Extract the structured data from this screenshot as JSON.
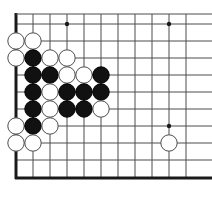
{
  "diagram": {
    "kind": "go-board-corner-diagram",
    "board": {
      "origin_x": 16,
      "origin_y": 24,
      "cell": 17,
      "cols": 11,
      "rows": 9,
      "edge_left_x": 16,
      "edge_top_y": 14,
      "edge_bottom_y": 178,
      "line_color": "#4d4d4d",
      "edge_color": "#1a1a1a",
      "background": "#ffffff",
      "line_width": 1,
      "edge_width": 3
    },
    "star_points": [
      {
        "col": 3,
        "row": 0
      },
      {
        "col": 9,
        "row": 0
      },
      {
        "col": 9,
        "row": 6
      }
    ],
    "star_point_radius": 2.2,
    "stone_radius": 8.2,
    "stones": [
      {
        "col": 0,
        "row": 1,
        "color": "white"
      },
      {
        "col": 1,
        "row": 1,
        "color": "white"
      },
      {
        "col": 0,
        "row": 2,
        "color": "white"
      },
      {
        "col": 1,
        "row": 2,
        "color": "black"
      },
      {
        "col": 2,
        "row": 2,
        "color": "white"
      },
      {
        "col": 3,
        "row": 2,
        "color": "white"
      },
      {
        "col": 1,
        "row": 3,
        "color": "black"
      },
      {
        "col": 2,
        "row": 3,
        "color": "black"
      },
      {
        "col": 3,
        "row": 3,
        "color": "white"
      },
      {
        "col": 4,
        "row": 3,
        "color": "white"
      },
      {
        "col": 5,
        "row": 3,
        "color": "black"
      },
      {
        "col": 1,
        "row": 4,
        "color": "black"
      },
      {
        "col": 2,
        "row": 4,
        "color": "white"
      },
      {
        "col": 3,
        "row": 4,
        "color": "black"
      },
      {
        "col": 4,
        "row": 4,
        "color": "black"
      },
      {
        "col": 5,
        "row": 4,
        "color": "black"
      },
      {
        "col": 1,
        "row": 5,
        "color": "black"
      },
      {
        "col": 2,
        "row": 5,
        "color": "white"
      },
      {
        "col": 3,
        "row": 5,
        "color": "black"
      },
      {
        "col": 4,
        "row": 5,
        "color": "black"
      },
      {
        "col": 5,
        "row": 5,
        "color": "white"
      },
      {
        "col": 0,
        "row": 6,
        "color": "white"
      },
      {
        "col": 1,
        "row": 6,
        "color": "black"
      },
      {
        "col": 2,
        "row": 6,
        "color": "white"
      },
      {
        "col": 0,
        "row": 7,
        "color": "white"
      },
      {
        "col": 1,
        "row": 7,
        "color": "white"
      },
      {
        "col": 9,
        "row": 7,
        "color": "white"
      }
    ],
    "colors": {
      "black_fill": "#111111",
      "black_stroke": "#000000",
      "white_fill": "#ffffff",
      "white_stroke": "#4d4d4d"
    }
  }
}
